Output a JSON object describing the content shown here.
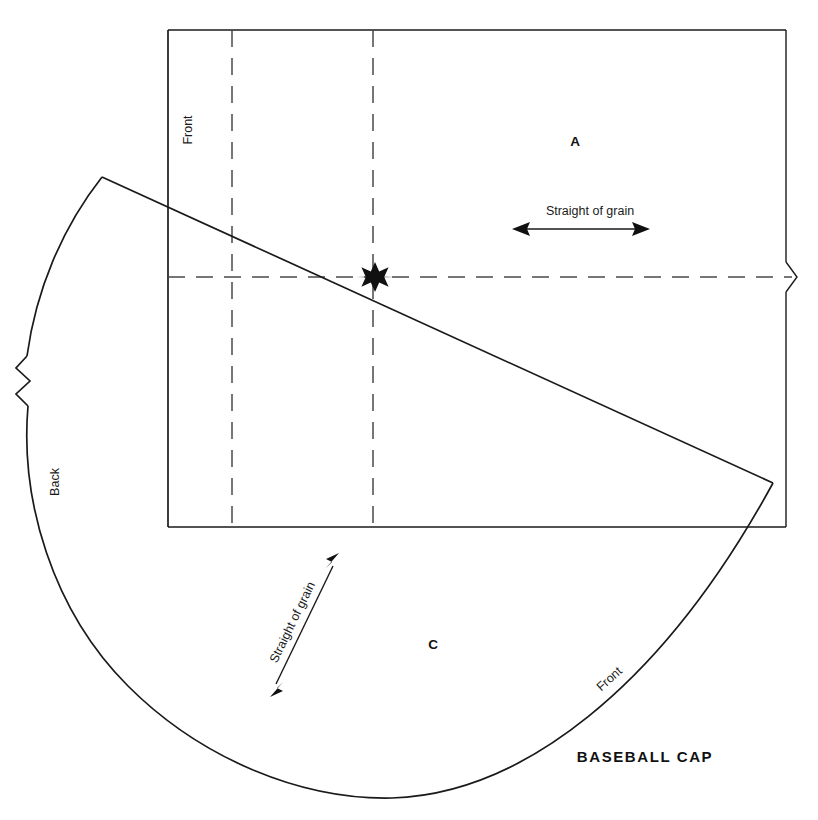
{
  "diagram": {
    "title": "BASEBALL CAP",
    "type": "sewing-pattern",
    "pieces": [
      {
        "id": "A",
        "label": "A",
        "shape": "rectangle",
        "x": 575,
        "y": 141
      },
      {
        "id": "C",
        "label": "C",
        "shape": "wedge",
        "x": 433,
        "y": 644
      }
    ],
    "edge_labels": [
      {
        "name": "front-edge-rectangle",
        "text": "Front",
        "x": 192,
        "y": 130,
        "rotation": -90
      },
      {
        "name": "back-edge-wedge",
        "text": "Back",
        "x": 59,
        "y": 482,
        "rotation": -90
      },
      {
        "name": "front-edge-wedge",
        "text": "Front",
        "x": 612,
        "y": 682,
        "rotation": -42
      }
    ],
    "grain_arrows": [
      {
        "name": "grain-arrow-horizontal",
        "text": "Straight of grain",
        "label_x": 590,
        "label_y": 215,
        "label_rotation": 0,
        "x1": 514,
        "y1": 229,
        "x2": 648,
        "y2": 229
      },
      {
        "name": "grain-arrow-diagonal",
        "text": "Straight of grain",
        "label_x": 296,
        "label_y": 624,
        "label_rotation": -64,
        "x1": 272,
        "y1": 694,
        "x2": 337,
        "y2": 556
      }
    ],
    "markers": [
      {
        "name": "center-star-marker",
        "symbol": "eight-point-star",
        "x": 375,
        "y": 277
      }
    ],
    "break_marks": [
      {
        "name": "break-mark-right",
        "x": 786,
        "y": 277
      },
      {
        "name": "break-mark-left",
        "x": 27,
        "y": 388
      }
    ],
    "rectangle": {
      "left": 168,
      "top": 30,
      "right": 786,
      "bottom": 527
    },
    "fold_lines": [
      {
        "name": "fold-line-vertical-1",
        "x": 232
      },
      {
        "name": "fold-line-vertical-2",
        "x": 373
      },
      {
        "name": "fold-line-horizontal",
        "y": 277
      }
    ],
    "colors": {
      "stroke": "#1a1a1a",
      "dash": "#4a4a4a",
      "background": "#ffffff",
      "marker": "#111111"
    }
  }
}
